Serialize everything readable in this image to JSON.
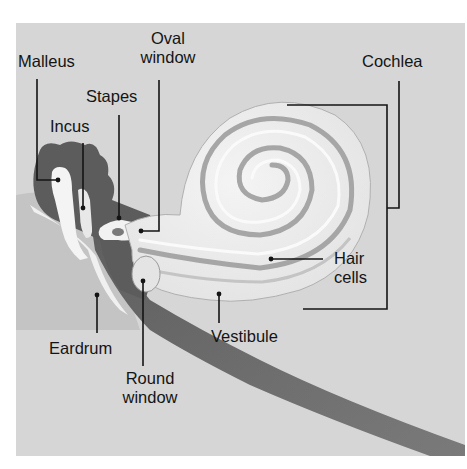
{
  "colors": {
    "background": "#d6d6d6",
    "dark_tissue": "#6a6a6a",
    "bone_light": "#f2f2f2",
    "cochlea_fill": "#ececec",
    "cochlea_groove": "#a8a8a8",
    "leader_line": "#141414"
  },
  "labels": {
    "malleus": "Malleus",
    "oval_window_line1": "Oval",
    "oval_window_line2": "window",
    "stapes": "Stapes",
    "incus": "Incus",
    "cochlea": "Cochlea",
    "hair_cells_line1": "Hair",
    "hair_cells_line2": "cells",
    "vestibule": "Vestibule",
    "eardrum": "Eardrum",
    "round_window_line1": "Round",
    "round_window_line2": "window"
  }
}
